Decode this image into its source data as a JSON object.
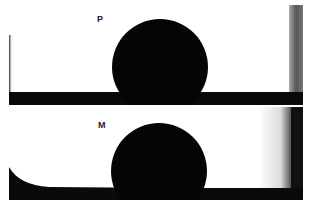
{
  "panels": [
    {
      "label": "P"
    },
    {
      "label": "M"
    }
  ]
}
